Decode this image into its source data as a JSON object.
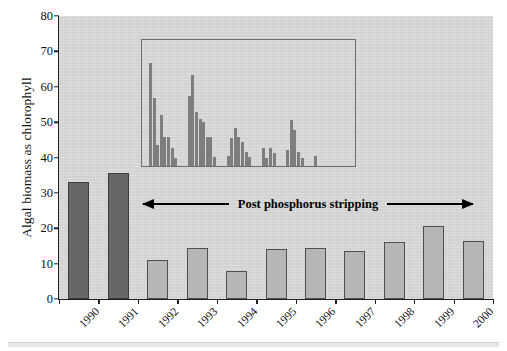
{
  "figure": {
    "background_color": "#ffffff",
    "plot_background_color": "#d8d8d8",
    "bottom_rule": ""
  },
  "chart_data": {
    "type": "bar",
    "title": "",
    "xlabel": "",
    "ylabel": "Algal biomass as chlorophyll",
    "ylim": [
      0,
      80
    ],
    "ytick_labels": [
      "0",
      "10",
      "20",
      "30",
      "40",
      "50",
      "60",
      "70",
      "80"
    ],
    "ytick_values": [
      0,
      10,
      20,
      30,
      40,
      50,
      60,
      70,
      80
    ],
    "grid": false,
    "legend": "none",
    "categories": [
      "1990",
      "1991",
      "1992",
      "1993",
      "1994",
      "1995",
      "1996",
      "1997",
      "1998",
      "1999",
      "2000"
    ],
    "values": [
      33,
      35.5,
      11,
      14.5,
      8,
      14,
      14.5,
      13.5,
      16,
      20.5,
      16.5
    ],
    "bar_colors": [
      "#676767",
      "#676767",
      "#b6b6b6",
      "#b6b6b6",
      "#b6b6b6",
      "#b6b6b6",
      "#b6b6b6",
      "#b6b6b6",
      "#b6b6b6",
      "#b6b6b6",
      "#b6b6b6"
    ],
    "annotation": {
      "text": "Post phosphorus stripping",
      "style": "double-headed-arrow",
      "x_start": "1992",
      "x_end": "2000"
    },
    "inset": {
      "type": "bar",
      "title": "",
      "xlabel": "",
      "ylabel": "",
      "ylim": [
        0,
        80
      ],
      "note": "High-resolution sub-annual (seasonal) chlorophyll series 1992-1997 plotted on the same vertical scale as the main axis.",
      "groups": [
        {
          "label": "1992",
          "values": [
            71,
            58,
            41,
            52,
            44,
            44,
            40,
            36
          ]
        },
        {
          "label": "1993",
          "values": [
            59,
            66.5,
            53,
            50.5,
            49.5,
            44,
            44,
            36.5
          ]
        },
        {
          "label": "1994",
          "values": [
            37,
            43.5,
            47,
            44,
            42,
            38.5,
            36.5
          ]
        },
        {
          "label": "1995",
          "values": [
            40,
            36,
            40,
            38
          ]
        },
        {
          "label": "1996",
          "values": [
            39,
            50,
            46.5,
            38.5,
            36
          ]
        },
        {
          "label": "1997",
          "values": [
            37
          ]
        }
      ]
    }
  },
  "axes": {
    "y_title": "Algal biomass as chlorophyll"
  }
}
